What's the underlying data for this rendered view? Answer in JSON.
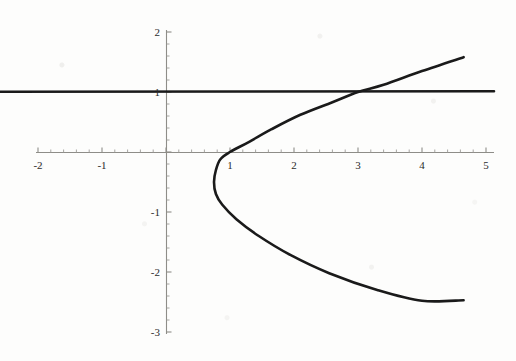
{
  "chart_data": {
    "type": "line",
    "title": "",
    "subtitle": "",
    "xlabel": "",
    "ylabel": "",
    "xlim": [
      -2,
      5
    ],
    "ylim": [
      -3,
      2
    ],
    "grid": false,
    "legend": "none",
    "axis_style": "mathematica-cross-axes",
    "x_ticks": [
      -2,
      -1,
      0,
      1,
      2,
      3,
      4,
      5
    ],
    "x_tick_labels": [
      "-2",
      "-1",
      "",
      "1",
      "2",
      "3",
      "4",
      "5"
    ],
    "y_ticks": [
      -3,
      -2,
      -1,
      0,
      1,
      2
    ],
    "y_tick_labels": [
      "-3",
      "-2",
      "-1",
      "",
      "1",
      "2"
    ],
    "x_minor_tick_step": 0.2,
    "y_minor_tick_step": 0.2,
    "series": [
      {
        "name": "horizontal-line",
        "type": "line",
        "equation": "y = 1",
        "color": "#1a1a1a",
        "linewidth": 2.6,
        "x": [
          -2,
          5
        ],
        "values": [
          1,
          1
        ]
      },
      {
        "name": "parabola",
        "type": "parametric-curve",
        "equation": "x = y^2 + y + 1",
        "color": "#1a1a1a",
        "linewidth": 2.6,
        "vertex": [
          0.75,
          -0.5
        ],
        "x_axis_crossing": 0.85,
        "points": [
          [
            4.65,
            1.58
          ],
          [
            4.0,
            1.35
          ],
          [
            3.4,
            1.12
          ],
          [
            3.0,
            1.0
          ],
          [
            2.6,
            0.83
          ],
          [
            2.1,
            0.62
          ],
          [
            1.65,
            0.38
          ],
          [
            1.3,
            0.17
          ],
          [
            1.0,
            0.0
          ],
          [
            0.85,
            -0.12
          ],
          [
            0.78,
            -0.3
          ],
          [
            0.75,
            -0.5
          ],
          [
            0.78,
            -0.7
          ],
          [
            0.88,
            -0.88
          ],
          [
            1.1,
            -1.12
          ],
          [
            1.45,
            -1.4
          ],
          [
            1.95,
            -1.72
          ],
          [
            2.55,
            -2.02
          ],
          [
            3.3,
            -2.3
          ],
          [
            4.0,
            -2.48
          ],
          [
            4.65,
            -2.47
          ]
        ]
      }
    ],
    "intersections": [
      {
        "x": 3.0,
        "y": 1.0
      }
    ]
  },
  "axes": {
    "x_tick_labels": [
      {
        "value": -2,
        "text": "-2"
      },
      {
        "value": -1,
        "text": "-1"
      },
      {
        "value": 1,
        "text": "1"
      },
      {
        "value": 2,
        "text": "2"
      },
      {
        "value": 3,
        "text": "3"
      },
      {
        "value": 4,
        "text": "4"
      },
      {
        "value": 5,
        "text": "5"
      }
    ],
    "y_tick_labels": [
      {
        "value": 2,
        "text": "2"
      },
      {
        "value": 1,
        "text": "1"
      },
      {
        "value": -1,
        "text": "-1"
      },
      {
        "value": -2,
        "text": "-2"
      },
      {
        "value": -3,
        "text": "-3"
      }
    ]
  },
  "colors": {
    "curve": "#1a1a1a",
    "axis": "#8e8d88",
    "background": "#fdfdfc",
    "tick_text": "#2b2b2b"
  }
}
